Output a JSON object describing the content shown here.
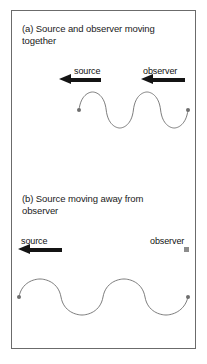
{
  "figure": {
    "background_color": "#ffffff",
    "border_color": "#6b6b6b",
    "wave_color": "#6e6e6e",
    "arrow_color": "#141414",
    "marker_color": "#8c8c8c",
    "text_color": "#1a1a1a"
  },
  "panels": [
    {
      "id": "a",
      "title": "(a) Source and observer moving together",
      "source": {
        "label": "source",
        "direction": "left",
        "marker": "arrow"
      },
      "observer": {
        "label": "observer",
        "direction": "left",
        "marker": "arrow"
      },
      "wave": {
        "cycles": 4,
        "amplitude_px": 17,
        "length_px": 109,
        "wavelength_px": 27.25,
        "description": "compressed wave between source and observer"
      }
    },
    {
      "id": "b",
      "title": "(b) Source moving away from observer",
      "source": {
        "label": "source",
        "direction": "left",
        "marker": "arrow"
      },
      "observer": {
        "label": "observer",
        "direction": "stationary",
        "marker": "square"
      },
      "wave": {
        "cycles": 4,
        "amplitude_px": 17,
        "length_px": 168,
        "wavelength_px": 42,
        "description": "stretched wave spanning full panel width"
      }
    }
  ]
}
